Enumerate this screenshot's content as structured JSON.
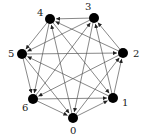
{
  "nodes": [
    {
      "id": "0",
      "x": 73,
      "y": 118,
      "lx": 70,
      "ly": 134
    },
    {
      "id": "1",
      "x": 113,
      "y": 98,
      "lx": 122,
      "ly": 106
    },
    {
      "id": "2",
      "x": 123,
      "y": 53,
      "lx": 133,
      "ly": 57
    },
    {
      "id": "3",
      "x": 94,
      "y": 18,
      "lx": 85,
      "ly": 10
    },
    {
      "id": "4",
      "x": 50,
      "y": 19,
      "lx": 37,
      "ly": 16
    },
    {
      "id": "5",
      "x": 22,
      "y": 54,
      "lx": 8,
      "ly": 57
    },
    {
      "id": "6",
      "x": 33,
      "y": 99,
      "lx": 22,
      "ly": 111
    }
  ],
  "edge_offsets": [
    1,
    2,
    4
  ]
}
